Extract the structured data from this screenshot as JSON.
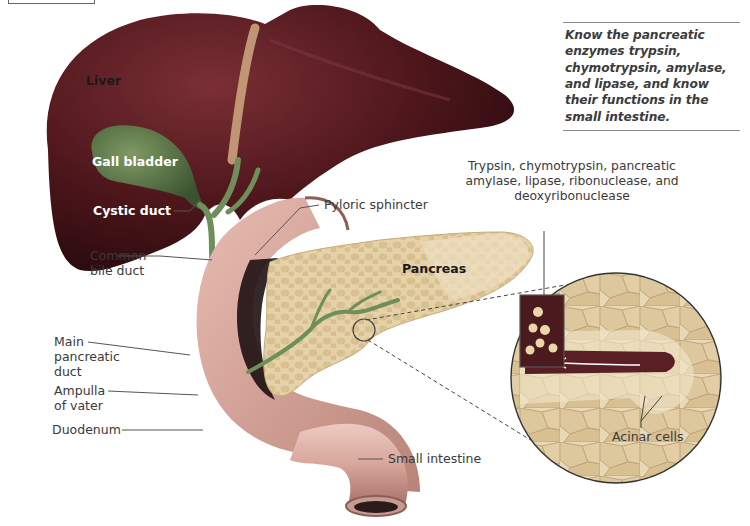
{
  "note": {
    "text": "Know the pancreatic enzymes trypsin, chymotrypsin, amylase, and lipase, and know their functions in the small intestine."
  },
  "labels": {
    "liver": "Liver",
    "gall_bladder": "Gall bladder",
    "cystic_duct": "Cystic duct",
    "common_bile_duct_1": "Common",
    "common_bile_duct_2": "bile duct",
    "pyloric_sphincter": "Pyloric sphincter",
    "pancreas": "Pancreas",
    "enzymes": "Trypsin, chymotrypsin, pancreatic amylase, lipase, ribonuclease, and deoxyribonuclease",
    "main_pancreatic_duct_1": "Main",
    "main_pancreatic_duct_2": "pancreatic",
    "main_pancreatic_duct_3": "duct",
    "ampulla_1": "Ampulla",
    "ampulla_2": "of vater",
    "duodenum": "Duodenum",
    "small_intestine": "Small intestine",
    "acinar_cells": "Acinar cells"
  },
  "colors": {
    "liver": "#5e1f24",
    "gall_bladder": "#4b6a3a",
    "duct": "#6f8f5a",
    "pancreas": "#e4cfa6",
    "duodenum": "#d8a79c",
    "background": "#ffffff",
    "leader": "#555555"
  }
}
